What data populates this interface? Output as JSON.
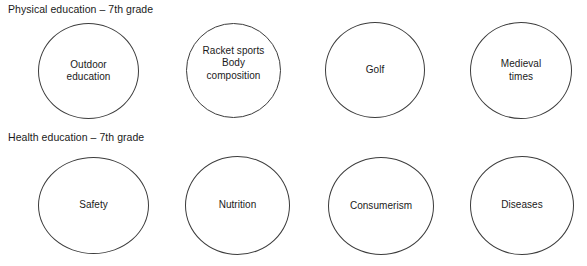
{
  "page": {
    "background_color": "#ffffff",
    "stroke_color": "#3c3c3c",
    "text_color": "#1a1a1a"
  },
  "sections": [
    {
      "heading": "Physical education – 7th grade",
      "circles": [
        {
          "label": "Outdoor\neducation"
        },
        {
          "label": "Racket sports\nBody\ncomposition"
        },
        {
          "label": "Golf"
        },
        {
          "label": "Medieval\ntimes"
        }
      ]
    },
    {
      "heading": "Health education – 7th grade",
      "circles": [
        {
          "label": "Safety"
        },
        {
          "label": "Nutrition"
        },
        {
          "label": "Consumerism"
        },
        {
          "label": "Diseases"
        }
      ]
    }
  ],
  "caption": {
    "text": ""
  }
}
